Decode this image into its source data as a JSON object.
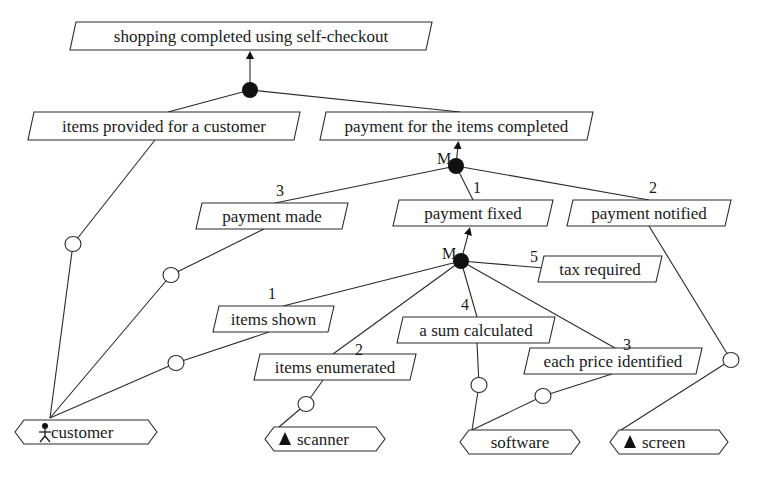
{
  "diagram": {
    "title": "shopping completed using self-checkout",
    "goals": [
      {
        "id": "g_root",
        "label": "shopping completed using self-checkout",
        "x": 70,
        "y": 22,
        "w": 362,
        "h": 28
      },
      {
        "id": "g_items_provided",
        "label": "items provided for a customer",
        "x": 28,
        "y": 112,
        "w": 272,
        "h": 28
      },
      {
        "id": "g_payment_completed",
        "label": "payment for the items completed",
        "x": 320,
        "y": 112,
        "w": 273,
        "h": 28
      },
      {
        "id": "g_payment_made",
        "label": "payment made",
        "x": 196,
        "y": 203,
        "w": 152,
        "h": 26
      },
      {
        "id": "g_payment_fixed",
        "label": "payment fixed",
        "x": 393,
        "y": 200,
        "w": 160,
        "h": 26
      },
      {
        "id": "g_payment_notified",
        "label": "payment notified",
        "x": 567,
        "y": 200,
        "w": 164,
        "h": 26
      },
      {
        "id": "g_tax_required",
        "label": "tax required",
        "x": 538,
        "y": 256,
        "w": 124,
        "h": 26
      },
      {
        "id": "g_items_shown",
        "label": "items shown",
        "x": 213,
        "y": 306,
        "w": 121,
        "h": 26
      },
      {
        "id": "g_sum_calculated",
        "label": "a sum calculated",
        "x": 397,
        "y": 317,
        "w": 158,
        "h": 26
      },
      {
        "id": "g_items_enumerated",
        "label": "items enumerated",
        "x": 254,
        "y": 354,
        "w": 162,
        "h": 26
      },
      {
        "id": "g_price_identified",
        "label": "each price identified",
        "x": 524,
        "y": 348,
        "w": 178,
        "h": 26
      }
    ],
    "agents": [
      {
        "id": "a_customer",
        "label": "customer",
        "icon": "person-icon",
        "x": 15,
        "y": 420,
        "w": 142,
        "h": 24
      },
      {
        "id": "a_scanner",
        "label": "scanner",
        "icon": "triangle-icon",
        "x": 265,
        "y": 427,
        "w": 120,
        "h": 24
      },
      {
        "id": "a_software",
        "label": "software",
        "icon": "",
        "x": 460,
        "y": 430,
        "w": 120,
        "h": 24
      },
      {
        "id": "a_screen",
        "label": "screen",
        "icon": "triangle-icon",
        "x": 610,
        "y": 430,
        "w": 118,
        "h": 24
      }
    ],
    "refinement_nodes": [
      {
        "id": "r_root",
        "x": 250,
        "y": 90,
        "label": ""
      },
      {
        "id": "r_payment",
        "x": 456,
        "y": 166,
        "label": "M"
      },
      {
        "id": "r_fixed",
        "x": 461,
        "y": 261,
        "label": "M"
      }
    ],
    "arrows": [
      {
        "from": [
          250,
          90
        ],
        "to": [
          250,
          51
        ]
      },
      {
        "from": [
          456,
          166
        ],
        "to": [
          458,
          141
        ]
      },
      {
        "from": [
          461,
          261
        ],
        "to": [
          469,
          227
        ]
      }
    ],
    "links": [
      {
        "from": [
          250,
          90
        ],
        "to": [
          168,
          112
        ]
      },
      {
        "from": [
          250,
          90
        ],
        "to": [
          460,
          112
        ]
      },
      {
        "from": [
          456,
          166
        ],
        "to": [
          275,
          203
        ]
      },
      {
        "from": [
          456,
          166
        ],
        "to": [
          473,
          200
        ]
      },
      {
        "from": [
          456,
          166
        ],
        "to": [
          649,
          200
        ]
      },
      {
        "from": [
          461,
          261
        ],
        "to": [
          544,
          268
        ]
      },
      {
        "from": [
          461,
          261
        ],
        "to": [
          283,
          306
        ]
      },
      {
        "from": [
          461,
          261
        ],
        "to": [
          333,
          354
        ]
      },
      {
        "from": [
          461,
          261
        ],
        "to": [
          477,
          317
        ]
      },
      {
        "from": [
          461,
          261
        ],
        "to": [
          615,
          348
        ]
      }
    ],
    "order_labels": [
      {
        "text": "3",
        "x": 280,
        "y": 196
      },
      {
        "text": "1",
        "x": 477,
        "y": 193
      },
      {
        "text": "2",
        "x": 653,
        "y": 193
      },
      {
        "text": "5",
        "x": 534,
        "y": 262
      },
      {
        "text": "1",
        "x": 272,
        "y": 299
      },
      {
        "text": "4",
        "x": 465,
        "y": 310
      },
      {
        "text": "2",
        "x": 359,
        "y": 355
      },
      {
        "text": "3",
        "x": 627,
        "y": 350
      }
    ],
    "responsibilities": [
      {
        "goal_point": [
          155,
          140
        ],
        "circle": [
          73,
          244
        ],
        "agent_point": [
          50,
          418
        ]
      },
      {
        "goal_point": [
          264,
          229
        ],
        "circle": [
          171,
          275
        ],
        "agent_point": [
          50,
          418
        ]
      },
      {
        "goal_point": [
          269,
          332
        ],
        "circle": [
          176,
          363
        ],
        "agent_point": [
          50,
          418
        ]
      },
      {
        "goal_point": [
          323,
          380
        ],
        "circle": [
          306,
          404
        ],
        "agent_point": [
          279,
          427
        ]
      },
      {
        "goal_point": [
          477,
          343
        ],
        "circle": [
          479,
          385
        ],
        "agent_point": [
          472,
          430
        ]
      },
      {
        "goal_point": [
          612,
          374
        ],
        "circle": [
          543,
          396
        ],
        "agent_point": [
          472,
          430
        ]
      },
      {
        "goal_point": [
          649,
          226
        ],
        "circle": [
          731,
          360
        ],
        "agent_point": [
          621,
          430
        ]
      }
    ]
  }
}
